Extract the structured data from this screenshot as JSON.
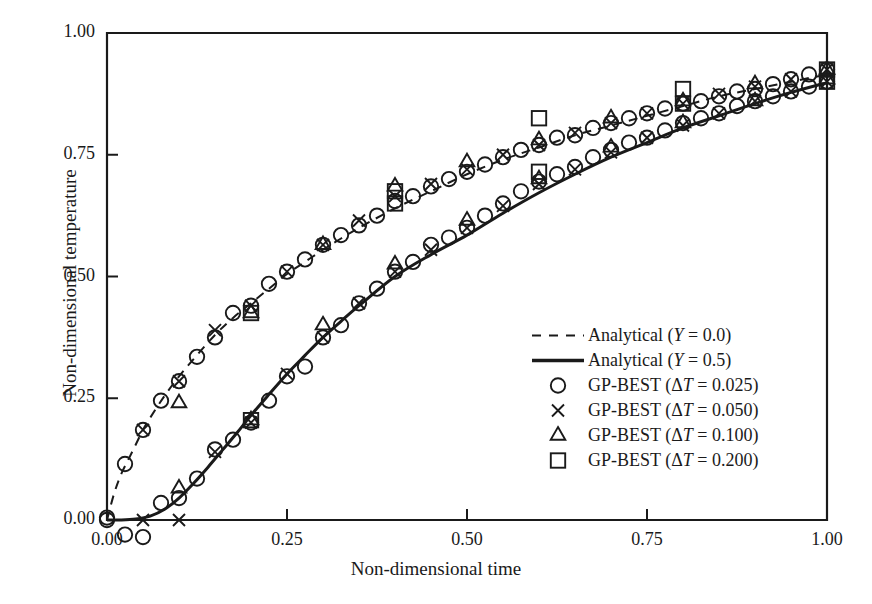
{
  "chart_data": {
    "type": "line",
    "title": "",
    "xlabel": "Non-dimensional time",
    "ylabel": "Non-dimensional temperature",
    "xlim": [
      0.0,
      1.0
    ],
    "ylim": [
      0.0,
      1.0
    ],
    "xticks": [
      "0.00",
      "0.25",
      "0.50",
      "0.75",
      "1.00"
    ],
    "xtick_values": [
      0.0,
      0.25,
      0.5,
      0.75,
      1.0
    ],
    "yticks": [
      "0.00",
      "0.25",
      "0.50",
      "0.75",
      "1.00"
    ],
    "ytick_values": [
      0.0,
      0.25,
      0.5,
      0.75,
      1.0
    ],
    "grid": false,
    "legend_position": "center-right",
    "series": [
      {
        "name": "Analytical (Y = 0.0)",
        "style": "dashed",
        "marker": "none",
        "color": "#1a1a1a",
        "x": [
          0.0,
          0.01,
          0.02,
          0.03,
          0.04,
          0.05,
          0.06,
          0.08,
          0.1,
          0.12,
          0.15,
          0.175,
          0.2,
          0.225,
          0.25,
          0.275,
          0.3,
          0.325,
          0.35,
          0.4,
          0.45,
          0.5,
          0.55,
          0.6,
          0.65,
          0.7,
          0.75,
          0.8,
          0.85,
          0.9,
          0.95,
          1.0
        ],
        "y": [
          0.0,
          0.055,
          0.095,
          0.125,
          0.155,
          0.185,
          0.21,
          0.255,
          0.295,
          0.33,
          0.38,
          0.415,
          0.445,
          0.475,
          0.505,
          0.53,
          0.555,
          0.578,
          0.6,
          0.64,
          0.675,
          0.71,
          0.74,
          0.765,
          0.79,
          0.81,
          0.83,
          0.85,
          0.87,
          0.885,
          0.9,
          0.915
        ]
      },
      {
        "name": "Analytical (Y = 0.5)",
        "style": "solid",
        "marker": "none",
        "color": "#1a1a1a",
        "x": [
          0.0,
          0.02,
          0.04,
          0.06,
          0.08,
          0.1,
          0.12,
          0.14,
          0.16,
          0.18,
          0.2,
          0.225,
          0.25,
          0.275,
          0.3,
          0.325,
          0.35,
          0.4,
          0.45,
          0.5,
          0.55,
          0.6,
          0.65,
          0.7,
          0.75,
          0.8,
          0.85,
          0.9,
          0.95,
          1.0
        ],
        "y": [
          0.0,
          0.0,
          0.002,
          0.008,
          0.022,
          0.045,
          0.075,
          0.108,
          0.143,
          0.178,
          0.215,
          0.258,
          0.3,
          0.338,
          0.375,
          0.408,
          0.44,
          0.5,
          0.545,
          0.585,
          0.63,
          0.672,
          0.71,
          0.745,
          0.775,
          0.805,
          0.83,
          0.855,
          0.878,
          0.898
        ]
      },
      {
        "name": "GP-BEST (ΔT = 0.025)",
        "style": "none",
        "marker": "circle",
        "color": "#1a1a1a",
        "branch_upper": {
          "x": [
            0.0,
            0.025,
            0.05,
            0.075,
            0.1,
            0.125,
            0.15,
            0.175,
            0.2,
            0.225,
            0.25,
            0.275,
            0.3,
            0.325,
            0.35,
            0.375,
            0.4,
            0.425,
            0.45,
            0.475,
            0.5,
            0.525,
            0.55,
            0.575,
            0.6,
            0.625,
            0.65,
            0.675,
            0.7,
            0.725,
            0.75,
            0.775,
            0.8,
            0.825,
            0.85,
            0.875,
            0.9,
            0.925,
            0.95,
            0.975,
            1.0
          ],
          "y": [
            0.005,
            0.115,
            0.185,
            0.245,
            0.285,
            0.335,
            0.375,
            0.425,
            0.44,
            0.485,
            0.51,
            0.535,
            0.565,
            0.585,
            0.605,
            0.625,
            0.655,
            0.665,
            0.685,
            0.7,
            0.715,
            0.73,
            0.745,
            0.76,
            0.77,
            0.785,
            0.79,
            0.805,
            0.815,
            0.825,
            0.835,
            0.845,
            0.855,
            0.86,
            0.87,
            0.88,
            0.885,
            0.895,
            0.905,
            0.915,
            0.925
          ]
        },
        "branch_lower": {
          "x": [
            0.0,
            0.025,
            0.05,
            0.075,
            0.1,
            0.125,
            0.15,
            0.175,
            0.2,
            0.225,
            0.25,
            0.275,
            0.3,
            0.325,
            0.35,
            0.375,
            0.4,
            0.425,
            0.45,
            0.475,
            0.5,
            0.525,
            0.55,
            0.575,
            0.6,
            0.625,
            0.65,
            0.675,
            0.7,
            0.725,
            0.75,
            0.775,
            0.8,
            0.825,
            0.85,
            0.875,
            0.9,
            0.925,
            0.95,
            0.975,
            1.0
          ],
          "y": [
            0.0,
            -0.03,
            -0.035,
            0.035,
            0.045,
            0.085,
            0.145,
            0.165,
            0.2,
            0.245,
            0.295,
            0.315,
            0.375,
            0.4,
            0.445,
            0.475,
            0.51,
            0.53,
            0.565,
            0.58,
            0.6,
            0.625,
            0.65,
            0.675,
            0.695,
            0.71,
            0.725,
            0.745,
            0.76,
            0.775,
            0.785,
            0.8,
            0.815,
            0.825,
            0.835,
            0.85,
            0.86,
            0.87,
            0.88,
            0.89,
            0.9
          ]
        }
      },
      {
        "name": "GP-BEST (ΔT = 0.050)",
        "style": "none",
        "marker": "cross",
        "color": "#1a1a1a",
        "branch_upper": {
          "x": [
            0.05,
            0.1,
            0.15,
            0.2,
            0.25,
            0.3,
            0.35,
            0.4,
            0.45,
            0.5,
            0.55,
            0.6,
            0.65,
            0.7,
            0.75,
            0.8,
            0.85,
            0.9,
            0.95,
            1.0
          ],
          "y": [
            0.185,
            0.285,
            0.39,
            0.44,
            0.51,
            0.565,
            0.615,
            0.665,
            0.69,
            0.72,
            0.75,
            0.77,
            0.795,
            0.815,
            0.835,
            0.855,
            0.875,
            0.89,
            0.905,
            0.925
          ]
        },
        "branch_lower": {
          "x": [
            0.05,
            0.1,
            0.15,
            0.2,
            0.25,
            0.3,
            0.35,
            0.4,
            0.45,
            0.5,
            0.55,
            0.6,
            0.65,
            0.7,
            0.75,
            0.8,
            0.85,
            0.9,
            0.95,
            1.0
          ],
          "y": [
            0.0,
            0.0,
            0.14,
            0.2,
            0.3,
            0.375,
            0.445,
            0.51,
            0.555,
            0.6,
            0.645,
            0.69,
            0.72,
            0.755,
            0.785,
            0.81,
            0.835,
            0.86,
            0.88,
            0.9
          ]
        }
      },
      {
        "name": "GP-BEST (ΔT = 0.100)",
        "style": "none",
        "marker": "triangle",
        "color": "#1a1a1a",
        "branch_upper": {
          "x": [
            0.1,
            0.2,
            0.3,
            0.4,
            0.5,
            0.6,
            0.7,
            0.8,
            0.9,
            1.0
          ],
          "y": [
            0.24,
            0.425,
            0.565,
            0.685,
            0.735,
            0.78,
            0.825,
            0.86,
            0.895,
            0.925
          ]
        },
        "branch_lower": {
          "x": [
            0.1,
            0.2,
            0.3,
            0.4,
            0.5,
            0.6,
            0.7,
            0.8,
            0.9,
            1.0
          ],
          "y": [
            0.065,
            0.205,
            0.4,
            0.525,
            0.615,
            0.7,
            0.765,
            0.815,
            0.86,
            0.905
          ]
        }
      },
      {
        "name": "GP-BEST (ΔT = 0.200)",
        "style": "none",
        "marker": "square",
        "color": "#1a1a1a",
        "branch_upper": {
          "x": [
            0.2,
            0.4,
            0.6,
            0.8,
            1.0
          ],
          "y": [
            0.425,
            0.675,
            0.825,
            0.885,
            0.925
          ]
        },
        "branch_lower": {
          "x": [
            0.2,
            0.4,
            0.6,
            0.8,
            1.0
          ],
          "y": [
            0.205,
            0.65,
            0.715,
            0.855,
            0.9
          ]
        }
      }
    ]
  },
  "axes": {
    "xlabel": "Non-dimensional time",
    "ylabel": "Non-dimensional temperature",
    "xtick_labels": [
      "0.00",
      "0.25",
      "0.50",
      "0.75",
      "1.00"
    ],
    "ytick_labels": [
      "0.00",
      "0.25",
      "0.50",
      "0.75",
      "1.00"
    ]
  },
  "legend": {
    "items": [
      {
        "key": "dashed-line",
        "label": "Analytical (",
        "var": "Y",
        "tail": " = 0.0)"
      },
      {
        "key": "solid-line",
        "label": "Analytical (",
        "var": "Y",
        "tail": " = 0.5)"
      },
      {
        "key": "circle-marker",
        "label": "GP-BEST (Δ",
        "var": "T",
        "tail": " = 0.025)"
      },
      {
        "key": "cross-marker",
        "label": "GP-BEST (Δ",
        "var": "T",
        "tail": " = 0.050)"
      },
      {
        "key": "triangle-marker",
        "label": "GP-BEST (Δ",
        "var": "T",
        "tail": " = 0.100)"
      },
      {
        "key": "square-marker",
        "label": "GP-BEST (Δ",
        "var": "T",
        "tail": " = 0.200)"
      }
    ]
  },
  "colors": {
    "ink": "#1a1a1a",
    "background": "#ffffff"
  }
}
